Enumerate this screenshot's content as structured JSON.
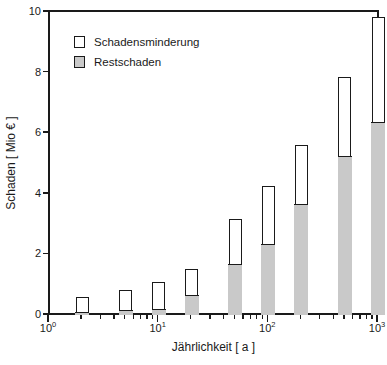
{
  "chart_data": {
    "type": "bar",
    "title": "",
    "subtitle": "",
    "xlabel": "Jährlichkeit [ a ]",
    "ylabel": "Schaden [ Mio € ]",
    "xscale": "log",
    "yscale": "linear",
    "xlim": [
      1,
      1000
    ],
    "ylim": [
      0,
      10
    ],
    "grid": false,
    "legend_position": "upper-left",
    "stacked": true,
    "x": [
      2,
      5,
      10,
      20,
      50,
      100,
      200,
      500,
      1000
    ],
    "categories": [
      "2",
      "5",
      "10",
      "20",
      "50",
      "100",
      "200",
      "500",
      "1000"
    ],
    "series": [
      {
        "name": "Restschaden",
        "color": "#c9c9c9",
        "values": [
          0.08,
          0.15,
          0.2,
          0.65,
          1.68,
          2.32,
          3.66,
          5.23,
          6.35
        ]
      },
      {
        "name": "Schadensminderung",
        "color": "#ffffff",
        "values": [
          0.47,
          0.65,
          0.85,
          0.85,
          1.47,
          1.9,
          1.92,
          2.6,
          3.45
        ]
      }
    ],
    "totals": [
      0.55,
      0.8,
      1.05,
      1.5,
      3.15,
      4.22,
      5.58,
      7.83,
      9.8
    ],
    "ytick_labels": [
      "0",
      "2",
      "4",
      "6",
      "8",
      "10"
    ],
    "ytick_values": [
      0,
      2,
      4,
      6,
      8,
      10
    ],
    "xtick_major_values": [
      1,
      10,
      100,
      1000
    ],
    "xtick_major_labels": [
      "10",
      "10",
      "10",
      "10"
    ],
    "xtick_major_exponents": [
      "0",
      "1",
      "2",
      "3"
    ],
    "xtick_minor_values": [
      2,
      3,
      4,
      5,
      6,
      7,
      8,
      9,
      20,
      30,
      40,
      50,
      60,
      70,
      80,
      90,
      200,
      300,
      400,
      500,
      600,
      700,
      800,
      900
    ]
  },
  "legend": {
    "items": [
      {
        "label": "Schadensminderung",
        "color": "#ffffff"
      },
      {
        "label": "Restschaden",
        "color": "#c9c9c9"
      }
    ]
  },
  "axes": {
    "x_title": "Jährlichkeit [ a ]",
    "y_title": "Schaden [ Mio € ]"
  },
  "colors": {
    "axis": "#1a1a1a",
    "bar_fill_residual": "#c9c9c9",
    "bar_fill_reduction": "#ffffff",
    "background": "#ffffff"
  }
}
